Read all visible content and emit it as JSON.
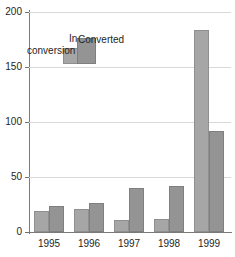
{
  "chart_data": {
    "type": "bar",
    "title": "",
    "subtitle": "",
    "xlabel": "",
    "ylabel": "",
    "categories": [
      "1995",
      "1996",
      "1997",
      "1998",
      "1999"
    ],
    "series": [
      {
        "name": "In conversion",
        "color": "#a6a6a6",
        "values": [
          19,
          21,
          11,
          12,
          184
        ]
      },
      {
        "name": "Converted",
        "color": "#949494",
        "values": [
          24,
          26,
          40,
          42,
          92
        ]
      }
    ],
    "ylim": [
      0,
      200
    ],
    "yticks": [
      0,
      50,
      100,
      150,
      200
    ],
    "ytick_labels": [
      "0",
      "50",
      "100",
      "150",
      "200"
    ],
    "grid": "horizontal",
    "legend_position": "inside-upper-left",
    "legend_entries": [
      {
        "label_line1": "In",
        "label_line2": "conversion",
        "swatch_color": "#a6a6a6"
      },
      {
        "label_line1": "Converted",
        "label_line2": "",
        "swatch_color": "#949494"
      }
    ]
  },
  "axes": {
    "y_ticks": [
      {
        "value": 200,
        "label": "200"
      },
      {
        "value": 150,
        "label": "150"
      },
      {
        "value": 100,
        "label": "100"
      },
      {
        "value": 50,
        "label": "50"
      },
      {
        "value": 0,
        "label": "0"
      }
    ],
    "x_ticks": [
      {
        "label": "1995"
      },
      {
        "label": "1996"
      },
      {
        "label": "1997"
      },
      {
        "label": "1998"
      },
      {
        "label": "1999"
      }
    ]
  },
  "legend": {
    "in_conversion_word1": "In",
    "in_conversion_word2": "conversion",
    "converted": "Converted"
  },
  "colors": {
    "series_in_conversion": "#a6a6a6",
    "series_converted": "#949494",
    "gridline": "#d9d9d9",
    "axis": "#7a7a7a",
    "text": "#1e1e1e",
    "background": "#ffffff"
  }
}
